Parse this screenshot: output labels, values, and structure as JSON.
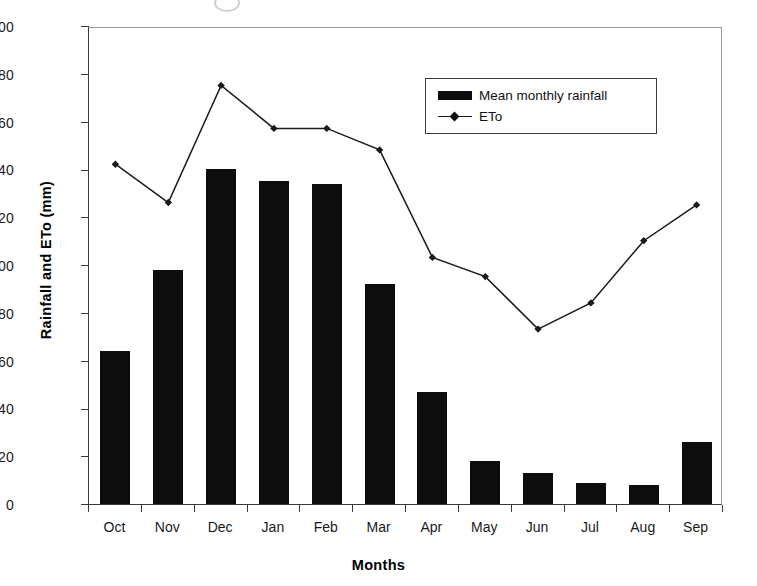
{
  "chart_data": {
    "type": "bar",
    "title": "",
    "xlabel": "Months",
    "ylabel": "Rainfall and ETo (mm)",
    "categories": [
      "Oct",
      "Nov",
      "Dec",
      "Jan",
      "Feb",
      "Mar",
      "Apr",
      "May",
      "Jun",
      "Jul",
      "Aug",
      "Sep"
    ],
    "ylim": [
      0,
      200
    ],
    "yticks": [
      0,
      20,
      40,
      60,
      80,
      100,
      120,
      140,
      160,
      180,
      200
    ],
    "grid": false,
    "legend_position": "upper-right-inside",
    "series": [
      {
        "name": "Mean monthly rainfall",
        "type": "bar",
        "color": "#0d0d0d",
        "values": [
          64,
          98,
          140,
          135,
          134,
          92,
          47,
          18,
          13,
          9,
          8,
          26
        ]
      },
      {
        "name": "ETo",
        "type": "line",
        "color": "#1a1a1a",
        "marker": "diamond",
        "values": [
          143,
          127,
          176,
          158,
          158,
          149,
          104,
          96,
          74,
          85,
          111,
          126
        ]
      }
    ]
  },
  "legend": {
    "items": [
      {
        "label": "Mean monthly rainfall",
        "swatch": "bar-swatch"
      },
      {
        "label": "ETo",
        "swatch": "line-marker-swatch"
      }
    ]
  }
}
